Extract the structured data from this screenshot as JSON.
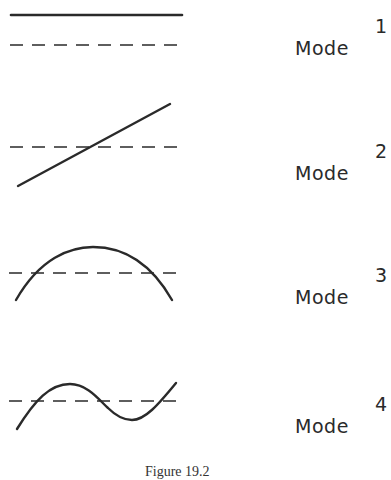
{
  "figure": {
    "caption": "Figure 19.2",
    "modes": [
      {
        "label": "Mode",
        "number": "1",
        "shape": "uniform"
      },
      {
        "label": "Mode",
        "number": "2",
        "shape": "linear"
      },
      {
        "label": "Mode",
        "number": "3",
        "shape": "arc"
      },
      {
        "label": "Mode",
        "number": "4",
        "shape": "sine"
      }
    ],
    "colors": {
      "line": "#2a2a2a",
      "background": "#ffffff"
    }
  }
}
